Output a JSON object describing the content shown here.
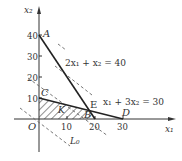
{
  "diagram": {
    "type": "linear-programming-feasible-region",
    "axes": {
      "x_label": "x₁",
      "y_label": "x₂",
      "origin_label": "O",
      "x_ticks": [
        "10",
        "20",
        "30"
      ],
      "y_ticks": [
        "10",
        "20",
        "30",
        "40"
      ]
    },
    "constraints": [
      {
        "equation": "2x₁ + x₂ = 40",
        "points": [
          "A",
          "B"
        ]
      },
      {
        "equation": "x₁ + 3x₂ = 30",
        "points": [
          "C",
          "D"
        ]
      }
    ],
    "points": [
      {
        "name": "A",
        "coords": [
          0,
          40
        ]
      },
      {
        "name": "B",
        "coords": [
          20,
          0
        ]
      },
      {
        "name": "C",
        "coords": [
          0,
          10
        ]
      },
      {
        "name": "D",
        "coords": [
          30,
          0
        ]
      },
      {
        "name": "E",
        "coords": [
          18,
          4
        ]
      },
      {
        "name": "O",
        "coords": [
          0,
          0
        ]
      }
    ],
    "region_label": "K",
    "objective_line_label": "L₀",
    "colors": {
      "line": "#222222",
      "axis": "#333333",
      "dashed": "#666666",
      "hatch": "#333333",
      "background": "#ffffff"
    }
  }
}
